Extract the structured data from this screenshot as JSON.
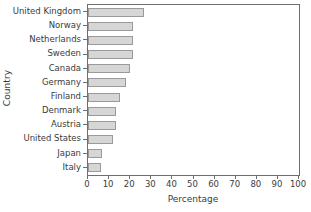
{
  "chart_data": {
    "type": "bar",
    "orientation": "horizontal",
    "title": "",
    "xlabel": "Percentage",
    "ylabel": "Country",
    "xlim": [
      0,
      100
    ],
    "xticks": [
      0,
      10,
      20,
      30,
      40,
      50,
      60,
      70,
      80,
      90,
      100
    ],
    "xticklabels": [
      "0",
      "10",
      "20",
      "30",
      "40",
      "50",
      "60",
      "70",
      "80",
      "90",
      "100"
    ],
    "grid": false,
    "legend": null,
    "categories": [
      "United Kingdom",
      "Norway",
      "Netherlands",
      "Sweden",
      "Canada",
      "Germany",
      "Finland",
      "Denmark",
      "Austria",
      "United States",
      "Japan",
      "Italy"
    ],
    "values": [
      26.5,
      21.5,
      21.5,
      21.5,
      20,
      18,
      15,
      13.5,
      13.5,
      12,
      6.8,
      6
    ],
    "bar_fill_color": "#d6d6d6",
    "bar_edge_color": "#9a9a9a",
    "axis_color": "#6e6e6e",
    "text_color": "#3b3b3b",
    "background_color": "#ffffff"
  }
}
